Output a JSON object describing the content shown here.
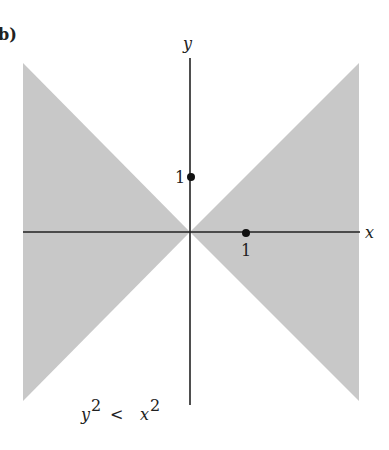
{
  "panel_label": "b)",
  "axes": {
    "x_label": "x",
    "y_label": "y",
    "x_tick": "1",
    "y_tick": "1"
  },
  "region": {
    "condition_lhs": "y",
    "condition_lhs_exp": "2",
    "condition_op": "<",
    "condition_rhs": "x",
    "condition_rhs_exp": "2",
    "fill_color": "#c8c8c8"
  },
  "colors": {
    "axis": "#222222",
    "shade": "#c8c8c8"
  }
}
